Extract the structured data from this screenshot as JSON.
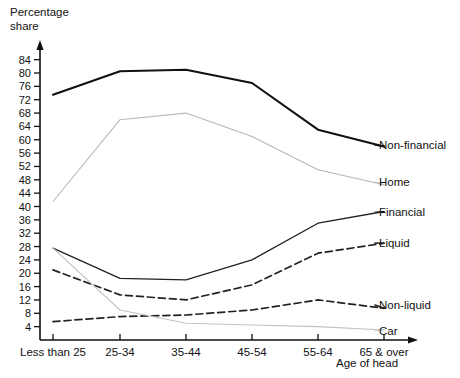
{
  "chart_data": {
    "type": "line",
    "title": "",
    "ylabel": "Percentage share",
    "xlabel": "Age of head",
    "categories": [
      "Less than 25",
      "25-34",
      "35-44",
      "45-54",
      "55-64",
      "65 & over"
    ],
    "yticks": [
      4,
      8,
      12,
      16,
      20,
      24,
      28,
      32,
      36,
      40,
      44,
      48,
      52,
      56,
      60,
      64,
      68,
      72,
      76,
      80,
      84
    ],
    "ylim": [
      0,
      86
    ],
    "grid": false,
    "legend_position": "right-of-plot-line-ends",
    "series": [
      {
        "name": "Non-financial",
        "style": "solid-thick",
        "color": "#111111",
        "values": [
          73.5,
          80.5,
          81.0,
          77.0,
          63.0,
          58.0
        ]
      },
      {
        "name": "Home",
        "style": "solid-thin",
        "color": "#b8b8b8",
        "values": [
          41.5,
          66.0,
          68.0,
          61.0,
          51.0,
          46.5
        ]
      },
      {
        "name": "Financial",
        "style": "solid",
        "color": "#222222",
        "values": [
          27.5,
          18.5,
          18.0,
          24.0,
          35.0,
          38.5
        ]
      },
      {
        "name": "Liquid",
        "style": "dashed",
        "color": "#222222",
        "values": [
          21.0,
          13.5,
          12.0,
          16.5,
          26.0,
          29.0
        ]
      },
      {
        "name": "Non-liquid",
        "style": "dashed",
        "color": "#222222",
        "values": [
          5.5,
          7.0,
          7.5,
          9.0,
          12.0,
          9.5
        ]
      },
      {
        "name": "Car",
        "style": "solid-thin",
        "color": "#c2c2c2",
        "values": [
          27.5,
          9.0,
          5.0,
          4.5,
          4.0,
          3.0
        ]
      }
    ]
  },
  "labels": {
    "y_axis_line1": "Percentage",
    "y_axis_line2": "share",
    "x_axis": "Age of head"
  }
}
